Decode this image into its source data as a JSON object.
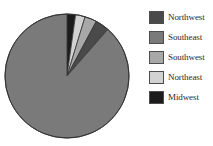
{
  "chart_data": {
    "type": "pie",
    "title": "",
    "categories": [
      "Northwest",
      "Southeast",
      "Southwest",
      "Northeast",
      "Midwest"
    ],
    "values": [
      3.6,
      88.6,
      3.1,
      2.5,
      2.2
    ],
    "units": "percent",
    "start_angle_deg": 0,
    "direction": "clockwise",
    "slice_order_clockwise_from_top": [
      "Midwest",
      "Northeast",
      "Southwest",
      "Northwest",
      "Southeast"
    ],
    "colors": [
      "#4a4a4a",
      "#7a7a7a",
      "#a8a8a8",
      "#d2d2d2",
      "#1c1c1c"
    ],
    "legend_position": "right",
    "grid": false,
    "xlabel": "",
    "ylabel": "",
    "data_labels": false,
    "slice_border_color": "#333333",
    "background": "#ffffff"
  },
  "pie": {
    "center_x": 67,
    "center_y": 76,
    "radius": 62,
    "slices": [
      {
        "name": "Midwest",
        "color": "#1c1c1c",
        "start_deg": 0,
        "end_deg": 8.0
      },
      {
        "name": "Northeast",
        "color": "#d2d2d2",
        "start_deg": 8.0,
        "end_deg": 17.0
      },
      {
        "name": "Southwest",
        "color": "#a8a8a8",
        "start_deg": 17.0,
        "end_deg": 28.2
      },
      {
        "name": "Northwest",
        "color": "#4a4a4a",
        "start_deg": 28.2,
        "end_deg": 41.2
      },
      {
        "name": "Southeast",
        "color": "#7a7a7a",
        "start_deg": 41.2,
        "end_deg": 360
      }
    ]
  },
  "legend": {
    "items": [
      {
        "label": "Northwest",
        "color": "#4a4a4a"
      },
      {
        "label": "Southeast",
        "color": "#7a7a7a"
      },
      {
        "label": "Southwest",
        "color": "#a8a8a8"
      },
      {
        "label": "Northeast",
        "color": "#d2d2d2"
      },
      {
        "label": "Midwest",
        "color": "#1c1c1c"
      }
    ]
  }
}
